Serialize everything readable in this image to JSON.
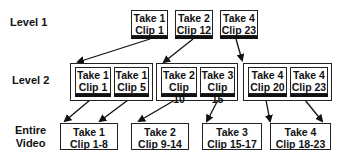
{
  "levels": {
    "level1": "Level 1",
    "level2": "Level 2",
    "entire_line1": "Entire",
    "entire_line2": "Video"
  },
  "level1_clips": [
    {
      "take": "Take 1",
      "clip": "Clip 1"
    },
    {
      "take": "Take 2",
      "clip": "Clip 12"
    },
    {
      "take": "Take 4",
      "clip": "Clip 23"
    }
  ],
  "level2_groups": [
    {
      "clips": [
        {
          "take": "Take 1",
          "clip": "Clip 1"
        },
        {
          "take": "Take 1",
          "clip": "Clip 5"
        }
      ]
    },
    {
      "clips": [
        {
          "take": "Take 2",
          "clip": "Clip 10"
        },
        {
          "take": "Take 3",
          "clip": "Clip 15"
        }
      ]
    },
    {
      "clips": [
        {
          "take": "Take 4",
          "clip": "Clip 20"
        },
        {
          "take": "Take 4",
          "clip": "Clip 23"
        }
      ]
    }
  ],
  "entire_video": [
    {
      "take": "Take 1",
      "clip": "Clip 1-8"
    },
    {
      "take": "Take 2",
      "clip": "Clip 9-14"
    },
    {
      "take": "Take 3",
      "clip": "Clip 15-17"
    },
    {
      "take": "Take 4",
      "clip": "Clip 18-23"
    }
  ]
}
